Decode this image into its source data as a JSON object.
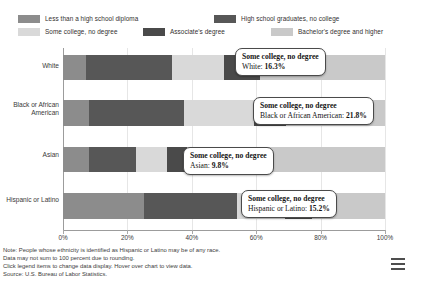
{
  "legend": {
    "items": [
      {
        "label": "Less than a high school diploma",
        "color": "#8c8c8c",
        "row": 1,
        "x": 0
      },
      {
        "label": "High school graduates, no college",
        "color": "#575757",
        "row": 1,
        "x": 196
      },
      {
        "label": "Some college, no degree",
        "color": "#d9d9d9",
        "row": 2,
        "x": 0
      },
      {
        "label": "Associate's degree",
        "color": "#4a4a4a",
        "row": 2,
        "x": 125
      },
      {
        "label": "Bachelor's degree and higher",
        "color": "#c9c9c9",
        "row": 2,
        "x": 253
      }
    ]
  },
  "chart_data": {
    "type": "bar",
    "orientation": "horizontal",
    "stacked": true,
    "title": "",
    "xlabel": "",
    "ylabel": "",
    "xlim": [
      0,
      100
    ],
    "xticks": [
      0,
      20,
      40,
      60,
      80,
      100
    ],
    "xticklabels": [
      "0%",
      "20%",
      "40%",
      "60%",
      "80%",
      "100%"
    ],
    "grid": true,
    "legend_position": "top",
    "categories": [
      "White",
      "Black or African American",
      "Asian",
      "Hispanic or Latino"
    ],
    "series": [
      {
        "name": "Less than a high school diploma",
        "color": "#8c8c8c",
        "values": [
          7.0,
          8.2,
          8.0,
          25.3
        ]
      },
      {
        "name": "High school graduates, no college",
        "color": "#575757",
        "values": [
          26.8,
          29.4,
          14.6,
          28.6
        ]
      },
      {
        "name": "Some college, no degree",
        "color": "#d9d9d9",
        "values": [
          16.3,
          21.8,
          9.8,
          15.2
        ]
      },
      {
        "name": "Associate's degree",
        "color": "#4a4a4a",
        "values": [
          11.0,
          9.9,
          6.1,
          8.2
        ]
      },
      {
        "name": "Bachelor's degree and higher",
        "color": "#c9c9c9",
        "values": [
          38.9,
          30.7,
          61.5,
          22.7
        ]
      }
    ]
  },
  "tooltips": [
    {
      "title": "Some college, no degree",
      "category": "White",
      "value": "16.3%"
    },
    {
      "title": "Some college, no degree",
      "category": "Black or African American",
      "value": "21.8%"
    },
    {
      "title": "Some college, no degree",
      "category": "Asian",
      "value": "9.8%"
    },
    {
      "title": "Some college, no degree",
      "category": "Hispanic or Latino",
      "value": "15.2%"
    }
  ],
  "notes": [
    "Note: People whose ethnicity is identified as Hispanic or Latino may be of any race.",
    "Data may not sum to 100 percent due to rounding.",
    "Click legend items to change data display. Hover over chart to view data.",
    "Source: U.S. Bureau of Labor Statistics."
  ],
  "menu": {
    "name": "chart-menu"
  }
}
